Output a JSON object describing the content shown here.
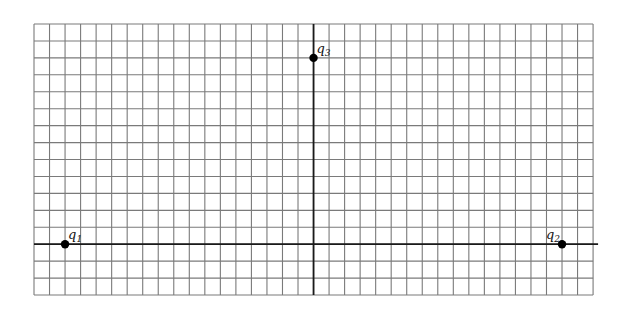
{
  "diagram": {
    "type": "charge-grid",
    "grid": {
      "columns": 36,
      "rows": 16,
      "left": 34,
      "top": 24,
      "cell_w": 15.53,
      "cell_h": 16.94,
      "line_color": "#7a7a7a",
      "axis_color": "#1a1a1a"
    },
    "axes": {
      "vertical_col": 18,
      "horizontal_row": 13,
      "horizontal_extends_right": 5
    },
    "charges": [
      {
        "id": "q1",
        "symbol": "q",
        "subscript": "1",
        "col": 2,
        "row": 13,
        "label_dx": 3,
        "label_dy": -5
      },
      {
        "id": "q2",
        "symbol": "q",
        "subscript": "2",
        "col": 34,
        "row": 13,
        "label_dx": -16,
        "label_dy": -5
      },
      {
        "id": "q3",
        "symbol": "q",
        "subscript": "3",
        "col": 18,
        "row": 2,
        "label_dx": 3,
        "label_dy": -5
      }
    ],
    "charge_color": "#000000"
  }
}
